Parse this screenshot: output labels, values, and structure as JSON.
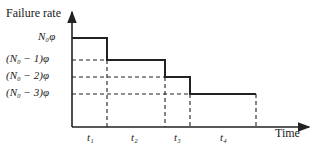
{
  "diagram": {
    "y_axis_label": "Failure rate",
    "x_axis_label": "Time",
    "levels": [
      {
        "label": "N₀φ"
      },
      {
        "label": "(N₀ − 1)φ"
      },
      {
        "label": "(N₀ − 2)φ"
      },
      {
        "label": "(N₀ − 3)φ"
      }
    ],
    "intervals": [
      {
        "label": "t₁"
      },
      {
        "label": "t₂"
      },
      {
        "label": "t₃"
      },
      {
        "label": "t₄"
      }
    ],
    "colors": {
      "line": "#222222"
    }
  }
}
